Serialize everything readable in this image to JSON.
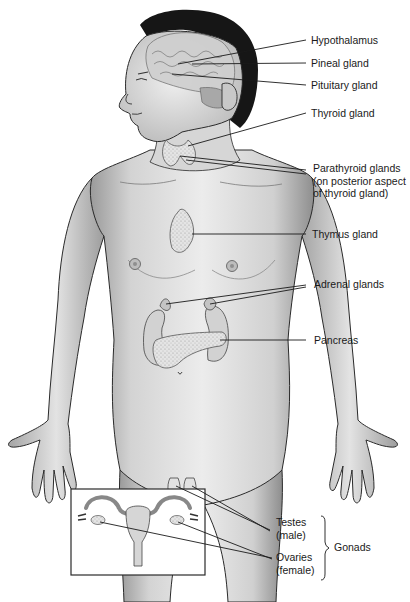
{
  "figure": {
    "colors": {
      "skin_light": "#e9e9e9",
      "skin_mid": "#c9c9c9",
      "skin_dark": "#8f8f8f",
      "outline": "#2a2a2a",
      "hair": "#161616",
      "gland": "#dcdcdc",
      "leader_line": "#1a1a1a",
      "label_text": "#1a1a1a"
    }
  },
  "labels": [
    {
      "id": "hypothalamus",
      "lines": [
        "Hypothalamus"
      ]
    },
    {
      "id": "pineal",
      "lines": [
        "Pineal gland"
      ]
    },
    {
      "id": "pituitary",
      "lines": [
        "Pituitary gland"
      ]
    },
    {
      "id": "thyroid",
      "lines": [
        "Thyroid gland"
      ]
    },
    {
      "id": "parathyroid",
      "lines": [
        "Parathyroid glands",
        "(on posterior aspect",
        "of thyroid gland)"
      ]
    },
    {
      "id": "thymus",
      "lines": [
        "Thymus gland"
      ]
    },
    {
      "id": "adrenal",
      "lines": [
        "Adrenal glands"
      ]
    },
    {
      "id": "pancreas",
      "lines": [
        "Pancreas"
      ]
    },
    {
      "id": "testes",
      "lines": [
        "Testes",
        "(male)"
      ]
    },
    {
      "id": "ovaries",
      "lines": [
        "Ovaries",
        "(female)"
      ]
    }
  ],
  "group_label": {
    "text": "Gonads",
    "members": [
      "testes",
      "ovaries"
    ]
  },
  "inset": {
    "description": "Female reproductive organs inset (uterus with ovaries)"
  }
}
